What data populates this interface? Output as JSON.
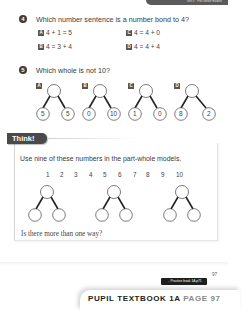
{
  "header": {
    "tab_text": "Unit 4 · Part-whole models"
  },
  "q4": {
    "number": "4",
    "text": "Which number sentence is a number bond to 4?",
    "options": [
      {
        "label": "A",
        "text": "4 + 1 = 5"
      },
      {
        "label": "B",
        "text": "4 = 3 + 4"
      },
      {
        "label": "C",
        "text": "4 = 4 + 0"
      },
      {
        "label": "D",
        "text": "4 = 4 + 4"
      }
    ]
  },
  "q5": {
    "number": "5",
    "text": "Which whole is not 10?",
    "models": [
      {
        "label": "A",
        "parts": [
          "5",
          "5"
        ]
      },
      {
        "label": "B",
        "parts": [
          "0",
          "10"
        ]
      },
      {
        "label": "C",
        "parts": [
          "1",
          "0"
        ]
      },
      {
        "label": "D",
        "parts": [
          "8",
          "2"
        ]
      }
    ]
  },
  "think": {
    "title": "Think!",
    "instruction": "Use nine of these numbers in the part-whole models.",
    "numbers": [
      "1",
      "2",
      "3",
      "4",
      "5",
      "6",
      "7",
      "8",
      "9",
      "10"
    ],
    "question": "Is there more than one way?"
  },
  "footer": {
    "practice_link": "→ Practice book 1A p71",
    "page_number": "97",
    "banner_main": "PUPIL TEXTBOOK 1A",
    "banner_page": "PAGE 97"
  }
}
